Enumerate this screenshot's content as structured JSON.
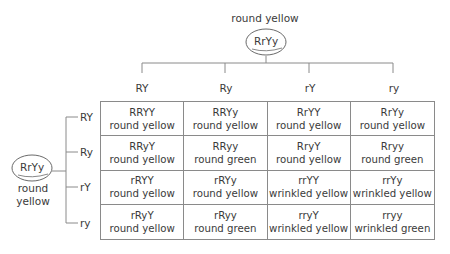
{
  "top_parent": {
    "phenotype": "round yellow",
    "genotype": "RrYy"
  },
  "left_parent": {
    "genotype": "RrYy",
    "phenotype_line1": "round",
    "phenotype_line2": "yellow"
  },
  "column_gametes": [
    "RY",
    "Ry",
    "rY",
    "ry"
  ],
  "row_gametes": [
    "RY",
    "Ry",
    "rY",
    "ry"
  ],
  "cells": [
    [
      {
        "genotype": "RRYY",
        "phenotype": "round yellow"
      },
      {
        "genotype": "RRYy",
        "phenotype": "round yellow"
      },
      {
        "genotype": "RrYY",
        "phenotype": "round yellow"
      },
      {
        "genotype": "RrYy",
        "phenotype": "round yellow"
      }
    ],
    [
      {
        "genotype": "RRyY",
        "phenotype": "round yellow"
      },
      {
        "genotype": "RRyy",
        "phenotype": "round green"
      },
      {
        "genotype": "RryY",
        "phenotype": "round yellow"
      },
      {
        "genotype": "Rryy",
        "phenotype": "round green"
      }
    ],
    [
      {
        "genotype": "rRYY",
        "phenotype": "round yellow"
      },
      {
        "genotype": "rRYy",
        "phenotype": "round yellow"
      },
      {
        "genotype": "rrYY",
        "phenotype": "wrinkled yellow"
      },
      {
        "genotype": "rrYy",
        "phenotype": "wrinkled yellow"
      }
    ],
    [
      {
        "genotype": "rRyY",
        "phenotype": "round yellow"
      },
      {
        "genotype": "rRyy",
        "phenotype": "round green"
      },
      {
        "genotype": "rryY",
        "phenotype": "wrinkled yellow"
      },
      {
        "genotype": "rryy",
        "phenotype": "wrinkled green"
      }
    ]
  ],
  "colors": {
    "line": "#8a8a8a",
    "text": "#3a3a3a"
  }
}
